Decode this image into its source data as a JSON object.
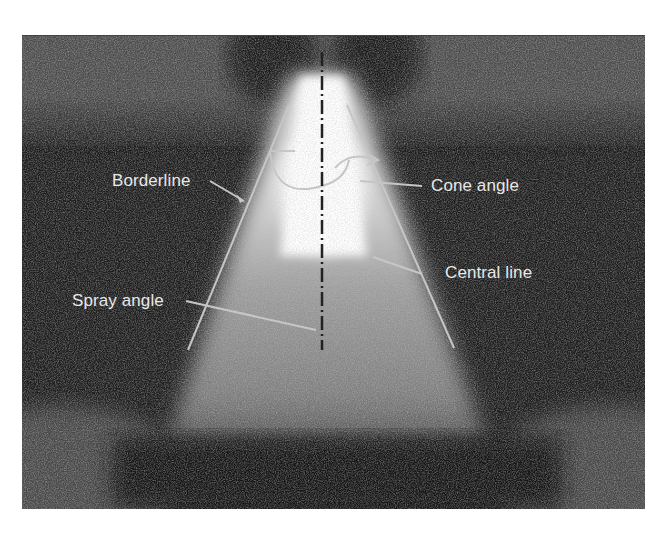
{
  "figure": {
    "palette": {
      "background": "#ffffff",
      "photo_dark": "#1c1c1c",
      "noise_light": "#8a8a8a",
      "spray_core": "#ffffff",
      "spray_body": "#b8b8b8",
      "annotation_line": "#c8c8c8",
      "center_line": "#2a2a2a",
      "label_text": "#e8e8e8"
    },
    "annotations": {
      "borderline": "Borderline",
      "cone_angle": "Cone angle",
      "central_line": "Central line",
      "spray_angle": "Spray angle"
    }
  }
}
